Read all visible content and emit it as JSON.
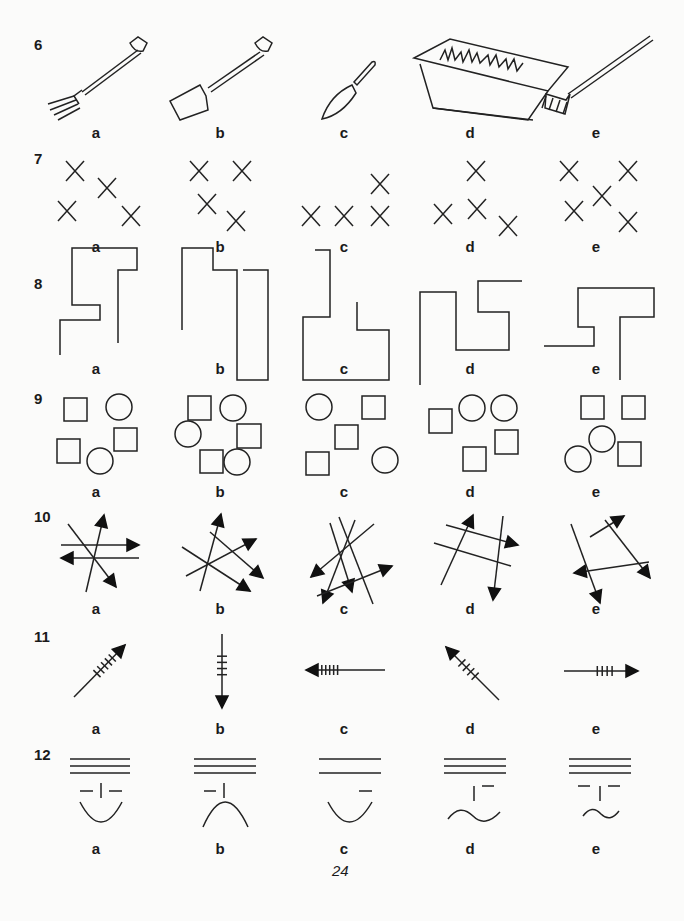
{
  "page_number": "24",
  "option_labels": [
    "a",
    "b",
    "c",
    "d",
    "e"
  ],
  "questions": [
    {
      "number": "6",
      "items": [
        "garden-fork",
        "spade",
        "trowel",
        "planter-box",
        "rake"
      ]
    },
    {
      "number": "7",
      "items": [
        "crosses",
        "crosses",
        "crosses",
        "crosses",
        "crosses"
      ]
    },
    {
      "number": "8",
      "items": [
        "line-shape",
        "line-shape",
        "line-shape",
        "line-shape",
        "line-shape"
      ]
    },
    {
      "number": "9",
      "items": [
        "squares-circles",
        "squares-circles",
        "squares-circles",
        "squares-circles",
        "squares-circles"
      ]
    },
    {
      "number": "10",
      "items": [
        "crossing-arrows",
        "crossing-arrows",
        "crossing-arrows",
        "crossing-arrows",
        "crossing-arrows"
      ]
    },
    {
      "number": "11",
      "items": [
        "feathered-arrow",
        "feathered-arrow",
        "feathered-arrow",
        "feathered-arrow",
        "feathered-arrow"
      ]
    },
    {
      "number": "12",
      "items": [
        "face-lines",
        "face-lines",
        "face-lines",
        "face-lines",
        "face-lines"
      ]
    }
  ]
}
